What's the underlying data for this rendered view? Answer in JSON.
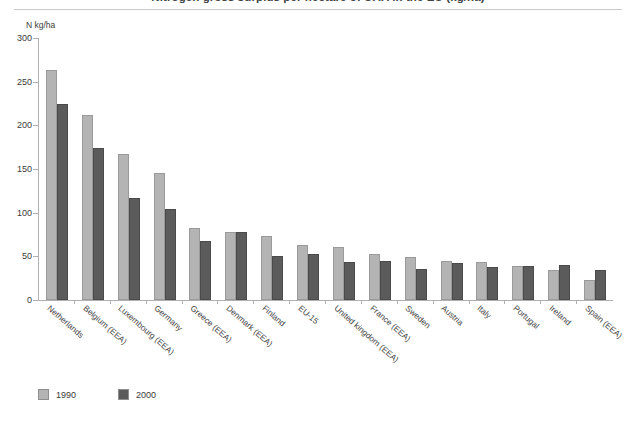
{
  "title": "Nitrogen gross surplus per hectare of UAA in the EU (kg/ha)",
  "axis_unit": "N kg/ha",
  "legend": [
    {
      "label": "1990",
      "color": "#b4b4b4"
    },
    {
      "label": "2000",
      "color": "#5b5b5b"
    }
  ],
  "chart_data": {
    "type": "bar",
    "title": "Nitrogen gross surplus per hectare of UAA in the EU (kg/ha)",
    "xlabel": "",
    "ylabel": "N kg/ha",
    "ylim": [
      0,
      300
    ],
    "yticks": [
      0,
      50,
      100,
      150,
      200,
      250,
      300
    ],
    "grid": false,
    "legend_position": "bottom-left",
    "categories": [
      "Netherlands",
      "Belgium (EEA)",
      "Luxembourg (EEA)",
      "Germany",
      "Greece (EEA)",
      "Denmark (EEA)",
      "Finland",
      "EU-15",
      "United kingdom (EEA)",
      "France (EEA)",
      "Sweden",
      "Austria",
      "Italy",
      "Portugal",
      "Ireland",
      "Spain (EEA)"
    ],
    "series": [
      {
        "name": "1990",
        "color": "#b4b4b4",
        "values": [
          263,
          212,
          167,
          146,
          82,
          78,
          73,
          63,
          61,
          53,
          49,
          45,
          43,
          39,
          34,
          23
        ]
      },
      {
        "name": "2000",
        "color": "#5b5b5b",
        "values": [
          225,
          174,
          117,
          104,
          68,
          78,
          50,
          53,
          43,
          45,
          35,
          42,
          38,
          39,
          40,
          34
        ]
      }
    ]
  }
}
